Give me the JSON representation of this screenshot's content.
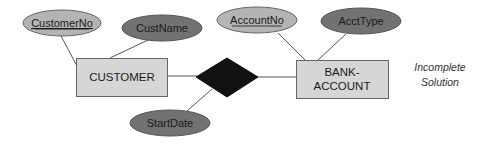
{
  "diagram": {
    "type": "ER diagram",
    "entities": [
      {
        "id": "customer",
        "label": "CUSTOMER"
      },
      {
        "id": "bank_account",
        "label_line1": "BANK-",
        "label_line2": "ACCOUNT"
      }
    ],
    "relationship": {
      "id": "rel",
      "label": "",
      "fill": "#111111"
    },
    "attributes": [
      {
        "id": "customer_no",
        "label": "CustomerNo",
        "key": true,
        "owner": "customer"
      },
      {
        "id": "cust_name",
        "label": "CustName",
        "key": false,
        "owner": "customer"
      },
      {
        "id": "account_no",
        "label": "AccountNo",
        "key": true,
        "owner": "bank_account"
      },
      {
        "id": "acct_type",
        "label": "AcctType",
        "key": false,
        "owner": "bank_account"
      },
      {
        "id": "start_date",
        "label": "StartDate",
        "key": false,
        "owner": "rel"
      }
    ],
    "note": {
      "line1": "Incomplete",
      "line2": "Solution"
    },
    "colors": {
      "entity_fill": "#d6d6d6",
      "key_attr_fill": "#b4b4b4",
      "attr_fill": "#727272",
      "relationship_fill": "#111111",
      "line": "#555555"
    }
  }
}
